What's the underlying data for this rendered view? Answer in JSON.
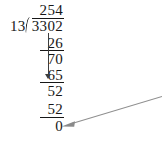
{
  "problem": {
    "type": "long-division",
    "divisor": "13",
    "dividend": "3302",
    "quotient": "254",
    "remainder": "0",
    "expression": "3302 / 13 = 254 r 0"
  },
  "work": {
    "quotient": "254",
    "dividend": "3302",
    "divisor": "13",
    "steps": [
      {
        "subtrahend": "26",
        "difference": "70"
      },
      {
        "subtrahend": "65",
        "difference": "52"
      },
      {
        "subtrahend": "52",
        "difference": "0"
      }
    ]
  },
  "annotations": {
    "bring_down_arrow": "bring-down-arrow",
    "pointer_arrow": "remainder-pointer-arrow"
  },
  "colors": {
    "ink": "#171717",
    "arrow": "#3d3d3d",
    "pointer": "#8a8a8a"
  }
}
